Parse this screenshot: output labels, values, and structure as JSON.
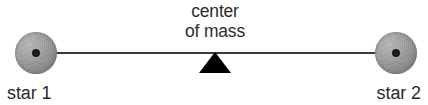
{
  "figure": {
    "background_color": "#ffffff",
    "width": 428,
    "height": 105
  },
  "labels": {
    "center_of_mass_line1": "center",
    "center_of_mass_line2": "of mass",
    "star1": "star 1",
    "star2": "star 2"
  },
  "colors": {
    "line": "#3a3a3a",
    "fulcrum": "#000000",
    "star_light": "#b9b9b9",
    "star_dark": "#646464",
    "center_dot": "#1a1a1a",
    "text": "#2b2b2b"
  },
  "geometry": {
    "star1_center_x": 36,
    "star1_center_y": 53,
    "star2_center_x": 396,
    "star2_center_y": 53,
    "star_diameter": 42,
    "center_of_mass_x": 215,
    "line_length": 360
  }
}
